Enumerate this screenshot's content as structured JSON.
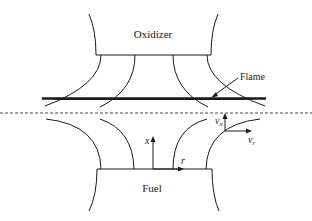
{
  "diagram": {
    "type": "counterflow-diffusion-flame",
    "labels": {
      "oxidizer": "Oxidizer",
      "flame": "Flame",
      "fuel": "Fuel",
      "x_axis": "x",
      "r_axis": "r",
      "vx": "v",
      "vx_sub": "x",
      "vr": "v",
      "vr_sub": "r"
    },
    "colors": {
      "ink": "#1a1a1a",
      "background": "#ffffff"
    }
  }
}
